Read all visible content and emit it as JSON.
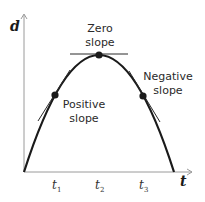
{
  "diagram": {
    "axes": {
      "y_label": "d",
      "x_label": "t",
      "x_ticks": [
        {
          "var": "t",
          "sub": "1"
        },
        {
          "var": "t",
          "sub": "2"
        },
        {
          "var": "t",
          "sub": "3"
        }
      ]
    },
    "annotations": {
      "zero": {
        "line1": "Zero",
        "line2": "slope"
      },
      "positive": {
        "line1": "Positive",
        "line2": "slope"
      },
      "negative": {
        "line1": "Negative",
        "line2": "slope"
      }
    },
    "colors": {
      "curve": "#1a1a1a",
      "axis": "#9a9a9a",
      "tangent": "#2a2a2a",
      "point": "#1a1a1a"
    }
  }
}
